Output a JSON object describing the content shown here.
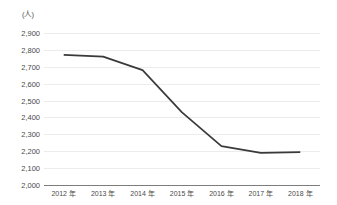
{
  "chart_data": {
    "type": "line",
    "title": "",
    "xlabel": "",
    "ylabel": "",
    "unit_label": "(人)",
    "categories": [
      "2012 年",
      "2013 年",
      "2014 年",
      "2015 年",
      "2016 年",
      "2017 年",
      "2018 年"
    ],
    "series": [
      {
        "name": "",
        "values": [
          2770,
          2760,
          2680,
          2430,
          2230,
          2190,
          2195
        ]
      }
    ],
    "ylim": [
      2000,
      2900
    ],
    "ytick_step": 100,
    "ytick_labels": [
      "2,900",
      "2,800",
      "2,700",
      "2,600",
      "2,500",
      "2,400",
      "2,300",
      "2,200",
      "2,100",
      "2,000"
    ],
    "ytick_values": [
      2900,
      2800,
      2700,
      2600,
      2500,
      2400,
      2300,
      2200,
      2100,
      2000
    ],
    "grid": true,
    "legend": "none",
    "colors": {
      "line": "#3a3a3a",
      "gridline": "#ececec",
      "baseline": "#7d7d7d",
      "text": "#4a4a4a",
      "background": "#ffffff"
    }
  }
}
